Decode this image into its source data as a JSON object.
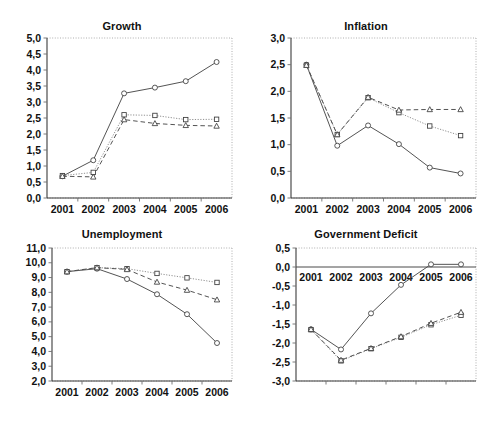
{
  "figure": {
    "panel_order": [
      "growth",
      "inflation",
      "unemployment",
      "deficit"
    ]
  },
  "chart_data": [
    {
      "id": "growth",
      "type": "line",
      "title": "Growth",
      "xlabel": "",
      "ylabel": "",
      "x": [
        "2001",
        "2002",
        "2003",
        "2004",
        "2005",
        "2006"
      ],
      "categories": [
        "2001",
        "2002",
        "2003",
        "2004",
        "2005",
        "2006"
      ],
      "ylim": [
        0.0,
        5.0
      ],
      "yticks": [
        "0,0",
        "0,5",
        "1,0",
        "1,5",
        "2,0",
        "2,5",
        "3,0",
        "3,5",
        "4,0",
        "4,5",
        "5,0"
      ],
      "ytick_values": [
        0.0,
        0.5,
        1.0,
        1.5,
        2.0,
        2.5,
        3.0,
        3.5,
        4.0,
        4.5,
        5.0
      ],
      "grid": false,
      "legend": "none",
      "series": [
        {
          "name": "series-circle-solid",
          "marker": "circle",
          "line": "solid",
          "values": [
            0.68,
            1.18,
            3.27,
            3.45,
            3.65,
            4.25
          ]
        },
        {
          "name": "series-square-dotted",
          "marker": "square",
          "line": "dotted",
          "values": [
            0.7,
            0.8,
            2.6,
            2.58,
            2.45,
            2.46
          ]
        },
        {
          "name": "series-triangle-dashed",
          "marker": "triangle",
          "line": "dashed",
          "values": [
            0.68,
            0.66,
            2.45,
            2.33,
            2.27,
            2.25
          ]
        }
      ]
    },
    {
      "id": "inflation",
      "type": "line",
      "title": "Inflation",
      "xlabel": "",
      "ylabel": "",
      "x": [
        "2001",
        "2002",
        "2003",
        "2004",
        "2005",
        "2006"
      ],
      "categories": [
        "2001",
        "2002",
        "2003",
        "2004",
        "2005",
        "2006"
      ],
      "ylim": [
        0.0,
        3.0
      ],
      "yticks": [
        "0,0",
        "0,5",
        "1,0",
        "1,5",
        "2,0",
        "2,5",
        "3,0"
      ],
      "ytick_values": [
        0.0,
        0.5,
        1.0,
        1.5,
        2.0,
        2.5,
        3.0
      ],
      "grid": false,
      "legend": "none",
      "series": [
        {
          "name": "series-circle-solid",
          "marker": "circle",
          "line": "solid",
          "values": [
            2.5,
            0.98,
            1.36,
            1.01,
            0.57,
            0.46
          ]
        },
        {
          "name": "series-square-dotted",
          "marker": "square",
          "line": "dotted",
          "values": [
            2.49,
            1.19,
            1.88,
            1.6,
            1.35,
            1.17
          ]
        },
        {
          "name": "series-triangle-dashed",
          "marker": "triangle",
          "line": "dashed",
          "values": [
            2.49,
            1.19,
            1.89,
            1.65,
            1.66,
            1.66
          ]
        }
      ]
    },
    {
      "id": "unemployment",
      "type": "line",
      "title": "Unemployment",
      "xlabel": "",
      "ylabel": "",
      "x": [
        "2001",
        "2002",
        "2003",
        "2004",
        "2005",
        "2006"
      ],
      "categories": [
        "2001",
        "2002",
        "2003",
        "2004",
        "2005",
        "2006"
      ],
      "ylim": [
        2.0,
        11.0
      ],
      "yticks": [
        "2,0",
        "3,0",
        "4,0",
        "5,0",
        "6,0",
        "7,0",
        "8,0",
        "9,0",
        "10,0",
        "11,0"
      ],
      "ytick_values": [
        2.0,
        3.0,
        4.0,
        5.0,
        6.0,
        7.0,
        8.0,
        9.0,
        10.0,
        11.0
      ],
      "grid": false,
      "legend": "none",
      "series": [
        {
          "name": "series-circle-solid",
          "marker": "circle",
          "line": "solid",
          "values": [
            9.4,
            9.6,
            8.9,
            7.87,
            6.52,
            4.57
          ]
        },
        {
          "name": "series-square-dotted",
          "marker": "square",
          "line": "dotted",
          "values": [
            9.4,
            9.67,
            9.6,
            9.28,
            8.98,
            8.67
          ]
        },
        {
          "name": "series-triangle-dashed",
          "marker": "triangle",
          "line": "dashed",
          "values": [
            9.4,
            9.67,
            9.55,
            8.7,
            8.15,
            7.5
          ]
        }
      ]
    },
    {
      "id": "deficit",
      "type": "line",
      "title": "Government Deficit",
      "xlabel": "",
      "ylabel": "",
      "x": [
        "2001",
        "2002",
        "2003",
        "2004",
        "2005",
        "2006"
      ],
      "categories": [
        "2001",
        "2002",
        "2003",
        "2004",
        "2005",
        "2006"
      ],
      "ylim": [
        -3.0,
        0.5
      ],
      "yticks": [
        "-3,0",
        "-2,5",
        "-2,0",
        "-1,5",
        "-1,0",
        "-0,5",
        "0,0",
        "0,5"
      ],
      "ytick_values": [
        -3.0,
        -2.5,
        -2.0,
        -1.5,
        -1.0,
        -0.5,
        0.0,
        0.5
      ],
      "grid": false,
      "legend": "none",
      "series": [
        {
          "name": "series-circle-solid",
          "marker": "circle",
          "line": "solid",
          "values": [
            -1.64,
            -2.17,
            -1.22,
            -0.47,
            0.07,
            0.07
          ]
        },
        {
          "name": "series-square-dotted",
          "marker": "square",
          "line": "dotted",
          "values": [
            -1.65,
            -2.47,
            -2.15,
            -1.85,
            -1.52,
            -1.27
          ]
        },
        {
          "name": "series-triangle-dashed",
          "marker": "triangle",
          "line": "dashed",
          "values": [
            -1.64,
            -2.45,
            -2.14,
            -1.83,
            -1.48,
            -1.19
          ]
        }
      ]
    }
  ]
}
